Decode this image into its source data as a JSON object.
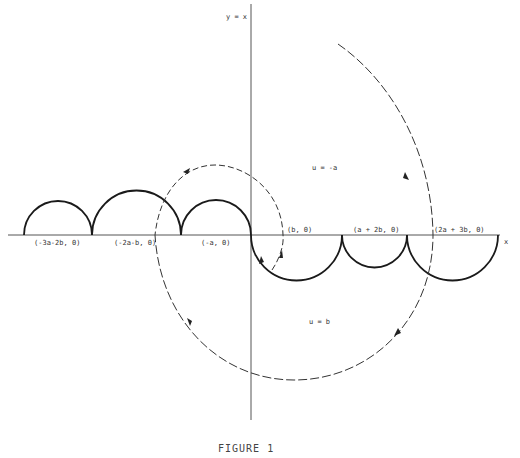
{
  "figure": {
    "caption": "FIGURE 1",
    "axes": {
      "y_label": "y = x",
      "x_label": "x"
    },
    "region_labels": {
      "upper": "u = -a",
      "lower": "u = b"
    },
    "points": [
      {
        "label": "(-3a-2b, 0)"
      },
      {
        "label": "(-2a-b, 0)"
      },
      {
        "label": "(-a, 0)"
      },
      {
        "label": "(b, 0)"
      },
      {
        "label": "(a + 2b, 0)"
      },
      {
        "label": "(2a + 3b, 0)"
      }
    ],
    "colors": {
      "stroke": "#1a1a1a",
      "axis": "#555555",
      "dashed": "#333333"
    }
  }
}
